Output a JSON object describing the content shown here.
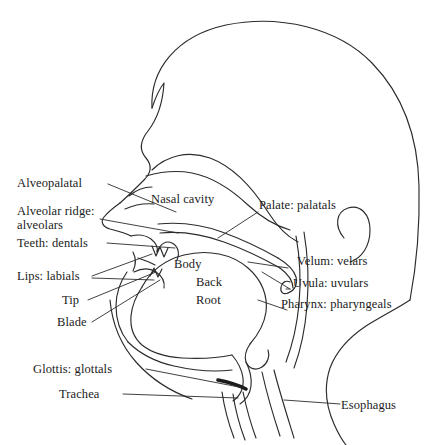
{
  "figure": {
    "type": "anatomical-diagram",
    "stroke_color": "#2b2b2b",
    "text_color": "#1b1b1b",
    "background_color": "#ffffff"
  },
  "labels": {
    "alveopalatal": "Alveopalatal",
    "alveolar_ridge": "Alveolar ridge:",
    "alveolars": "alveolars",
    "teeth_dentals": "Teeth: dentals",
    "lips_labials": "Lips: labials",
    "tip": "Tip",
    "blade": "Blade",
    "glottis_glottals": "Glottis: glottals",
    "trachea": "Trachea",
    "nasal_cavity": "Nasal cavity",
    "palate_palatals": "Palate: palatals",
    "velum_velars": "Velum: velars",
    "uvula_uvulars": "Uvula: uvulars",
    "pharynx_pharyngeals": "Pharynx: pharyngeals",
    "esophagus": "Esophagus",
    "body": "Body",
    "back": "Back",
    "root": "Root"
  },
  "label_groups": {
    "left_side": [
      "Alveopalatal",
      "Alveolar ridge: alveolars",
      "Teeth: dentals",
      "Lips: labials",
      "Tip",
      "Blade",
      "Glottis: glottals",
      "Trachea"
    ],
    "right_side": [
      "Palate: palatals",
      "Velum: velars",
      "Uvula: uvulars",
      "Pharynx: pharyngeals",
      "Esophagus"
    ],
    "interior": [
      "Nasal cavity",
      "Body",
      "Back",
      "Root"
    ]
  }
}
